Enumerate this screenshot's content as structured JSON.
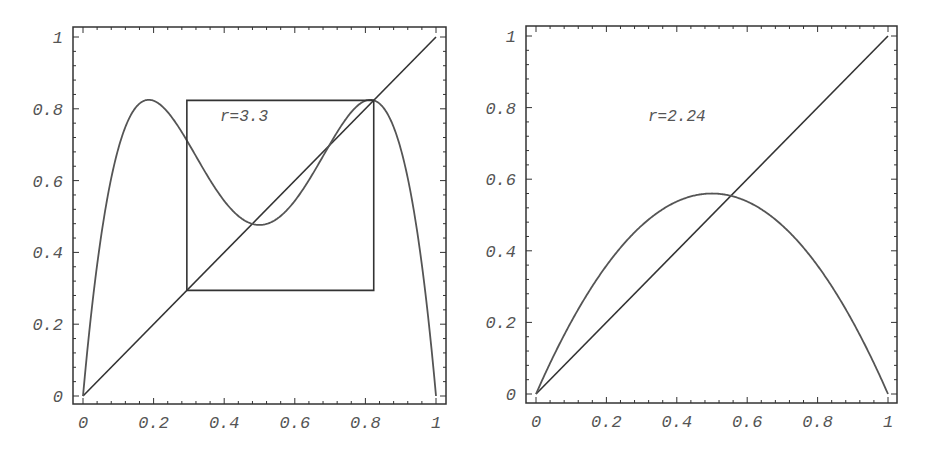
{
  "chart_data": [
    {
      "type": "line",
      "title": "",
      "annotation": "r=3.3",
      "xlabel": "",
      "ylabel": "",
      "xlim": [
        0,
        1
      ],
      "ylim": [
        0,
        1
      ],
      "xticks": [
        "0",
        "0.2",
        "0.4",
        "0.6",
        "0.8",
        "1"
      ],
      "yticks": [
        "0",
        "0.2",
        "0.4",
        "0.6",
        "0.8",
        "1"
      ],
      "grid": false,
      "series": [
        {
          "name": "f(f(x)) second iterate of logistic map, r=3.3",
          "r": 3.3,
          "function": "f(f(x)), f(x)=r x (1-x)"
        },
        {
          "name": "y = x",
          "x": [
            0,
            1
          ],
          "y": [
            0,
            1
          ]
        },
        {
          "name": "period-2 cycle box",
          "x": [
            0.2942,
            0.8236,
            0.8236,
            0.2942,
            0.2942
          ],
          "y": [
            0.2942,
            0.2942,
            0.8236,
            0.8236,
            0.2942
          ]
        }
      ]
    },
    {
      "type": "line",
      "title": "",
      "annotation": "r=2.24",
      "xlabel": "",
      "ylabel": "",
      "xlim": [
        0,
        1
      ],
      "ylim": [
        0,
        1
      ],
      "xticks": [
        "0",
        "0.2",
        "0.4",
        "0.6",
        "0.8",
        "1"
      ],
      "yticks": [
        "0",
        "0.2",
        "0.4",
        "0.6",
        "0.8",
        "1"
      ],
      "grid": false,
      "series": [
        {
          "name": "logistic map f(x)=r x (1-x), r=2.24",
          "r": 2.24,
          "function": "r x (1-x)",
          "peak": [
            0.5,
            0.56
          ]
        },
        {
          "name": "y = x",
          "x": [
            0,
            1
          ],
          "y": [
            0,
            1
          ]
        }
      ]
    }
  ],
  "panels": {
    "left": {
      "annotation": "r=3.3",
      "xticks": [
        "0",
        "0.2",
        "0.4",
        "0.6",
        "0.8",
        "1"
      ],
      "yticks": [
        "0",
        "0.2",
        "0.4",
        "0.6",
        "0.8",
        "1"
      ]
    },
    "right": {
      "annotation": "r=2.24",
      "xticks": [
        "0",
        "0.2",
        "0.4",
        "0.6",
        "0.8",
        "1"
      ],
      "yticks": [
        "0",
        "0.2",
        "0.4",
        "0.6",
        "0.8",
        "1"
      ]
    }
  },
  "colors": {
    "frame": "#333333",
    "curve": "#555555",
    "text": "#555555"
  }
}
